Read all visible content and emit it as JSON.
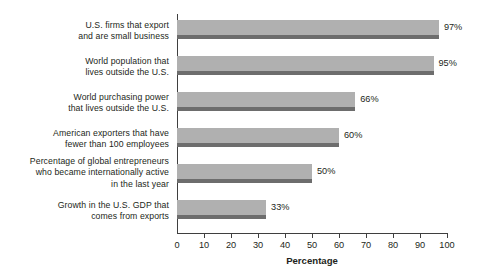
{
  "chart_data": {
    "type": "bar",
    "orientation": "horizontal",
    "title": "",
    "xlabel": "Percentage",
    "ylabel": "",
    "xlim": [
      0,
      100
    ],
    "grid": false,
    "legend": null,
    "xticks": [
      0,
      10,
      20,
      30,
      40,
      50,
      60,
      70,
      80,
      90,
      100
    ],
    "xtick_labels": [
      "0",
      "10",
      "20",
      "30",
      "40",
      "50",
      "60",
      "70",
      "80",
      "90",
      "100"
    ],
    "categories": [
      "U.S. firms that export\nand are small business",
      "World population that\nlives outside the U.S.",
      "World purchasing power\nthat lives outside the U.S.",
      "American exporters that have\nfewer than 100 employees",
      "Percentage of global entrepreneurs\nwho became internationally active\nin the last year",
      "Growth in the U.S. GDP that\ncomes from exports"
    ],
    "values": [
      97,
      95,
      66,
      60,
      50,
      33
    ],
    "value_labels": [
      "97%",
      "95%",
      "66%",
      "60%",
      "50%",
      "33%"
    ],
    "colors": {
      "bar_face": "#b0b0b0",
      "bar_shadow": "#6d6d6d",
      "axis": "#3f3f3f",
      "text": "#231f20",
      "background": "#ffffff"
    }
  }
}
